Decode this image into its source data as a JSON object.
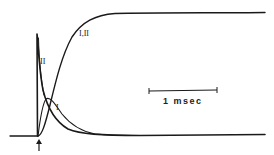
{
  "figure": {
    "labels": {
      "sigmoid": "I,II",
      "spike": "II",
      "slow": "I"
    },
    "scale_bar": {
      "label": "1 msec"
    },
    "stimulus_marker": "arrow-up-icon",
    "colors": {
      "ink": "#1a1a1a",
      "background": "#ffffff"
    }
  }
}
